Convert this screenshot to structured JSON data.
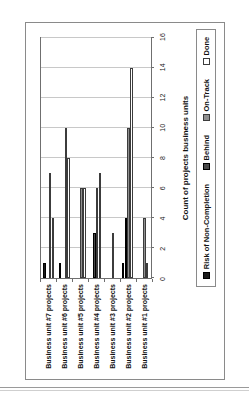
{
  "chart_data": {
    "type": "bar",
    "orientation": "horizontal",
    "title": "",
    "xlabel": "Count of projects business units",
    "ylabel": "",
    "xlim": [
      0,
      16
    ],
    "grid": true,
    "legend_position": "bottom",
    "categories": [
      "Business unit #7 projects",
      "Business unit #6 projects",
      "Business unit #5 projects",
      "Business unit #4 projects",
      "Business unit #3 projects",
      "Business unit #2 projects",
      "Business unit #1 projects"
    ],
    "tick_labels": [
      "0",
      "2",
      "4",
      "6",
      "8",
      "10",
      "12",
      "14",
      "16"
    ],
    "tick_values": [
      0,
      2,
      4,
      6,
      8,
      10,
      12,
      14,
      16
    ],
    "series": [
      {
        "name": "Risk of Non-Completion",
        "color": "#1c1c1c",
        "values": [
          1,
          1,
          0,
          0,
          0,
          1,
          0
        ]
      },
      {
        "name": "Behind",
        "color": "#4a4a4a",
        "values": [
          0,
          0,
          0,
          3,
          0,
          4,
          0
        ]
      },
      {
        "name": "On-Track",
        "color": "#909090",
        "values": [
          7,
          10,
          6,
          6,
          3,
          10,
          4
        ]
      },
      {
        "name": "Done",
        "color": "#ffffff",
        "values": [
          4,
          8,
          6,
          7,
          0,
          14,
          1
        ]
      }
    ]
  },
  "axis": {
    "title": "Count of projects business units"
  },
  "legend": {
    "items": [
      {
        "label": "Risk of Non-Completion",
        "swatch": "sw-risk"
      },
      {
        "label": "Behind",
        "swatch": "sw-behind"
      },
      {
        "label": "On-Track",
        "swatch": "sw-ontrack"
      },
      {
        "label": "Done",
        "swatch": "sw-done"
      }
    ]
  }
}
